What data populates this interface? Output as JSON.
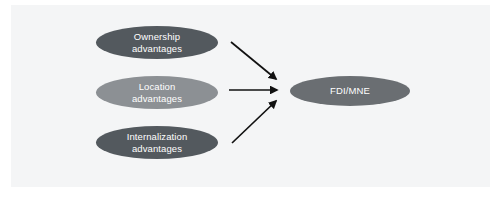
{
  "figure": {
    "background_color": "#ffffff",
    "panel_color": "#f4f5f6"
  },
  "nodes": {
    "ownership": {
      "line1": "Ownership",
      "line2": "advantages",
      "color": "#53595e",
      "text_color": "#ffffff"
    },
    "location": {
      "line1": "Location",
      "line2": "advantages",
      "color": "#8c9094",
      "text_color": "#ffffff"
    },
    "internalization": {
      "line1": "Internalization",
      "line2": "advantages",
      "color": "#53595e",
      "text_color": "#ffffff"
    },
    "outcome": {
      "line1": "FDI/MNE",
      "color": "#6a6e72",
      "text_color": "#ffffff"
    }
  },
  "arrows": {
    "color": "#111111",
    "top": {
      "name": "ownership-to-fdi-arrow"
    },
    "middle": {
      "name": "location-to-fdi-arrow"
    },
    "bottom": {
      "name": "internalization-to-fdi-arrow"
    }
  }
}
